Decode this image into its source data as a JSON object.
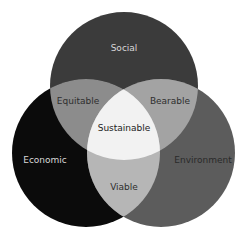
{
  "diagram": {
    "type": "venn-3",
    "circles": [
      {
        "id": "social",
        "label": "Social",
        "cx": 124,
        "cy": 86,
        "r": 74,
        "color": "#3b3b3b",
        "text_color": "#d8d8d8",
        "lx": 124,
        "ly": 48
      },
      {
        "id": "economic",
        "label": "Economic",
        "cx": 86,
        "cy": 153,
        "r": 74,
        "color": "#0b0b0b",
        "text_color": "#d8d8d8",
        "lx": 45,
        "ly": 160
      },
      {
        "id": "environment",
        "label": "Environment",
        "cx": 161,
        "cy": 153,
        "r": 74,
        "color": "#5c5c5c",
        "text_color": "#2a2a2a",
        "lx": 203,
        "ly": 160
      }
    ],
    "intersections": {
      "equitable": {
        "label": "Equitable",
        "color": "#8c8c8c",
        "text_color": "#2e2e2e",
        "lx": 78,
        "ly": 101
      },
      "bearable": {
        "label": "Bearable",
        "color": "#a3a3a3",
        "text_color": "#2e2e2e",
        "lx": 170,
        "ly": 101
      },
      "viable": {
        "label": "Viable",
        "color": "#b6b6b6",
        "text_color": "#2e2e2e",
        "lx": 124,
        "ly": 187
      },
      "sustainable": {
        "label": "Sustainable",
        "color": "#f2f2f2",
        "text_color": "#222222",
        "lx": 124,
        "ly": 128
      }
    }
  }
}
